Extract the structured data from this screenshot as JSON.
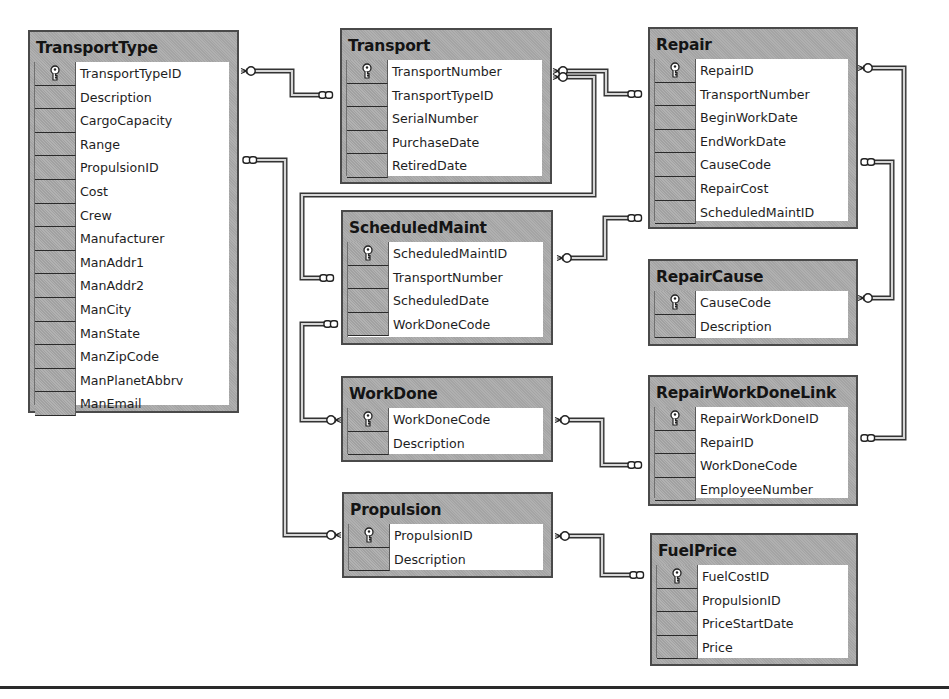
{
  "diagram": {
    "type": "database-schema",
    "tables": [
      {
        "name": "TransportType",
        "columns": [
          "TransportTypeID",
          "Description",
          "CargoCapacity",
          "Range",
          "PropulsionID",
          "Cost",
          "Crew",
          "Manufacturer",
          "ManAddr1",
          "ManAddr2",
          "ManCity",
          "ManState",
          "ManZipCode",
          "ManPlanetAbbrv",
          "ManEmail"
        ],
        "primary_key": "TransportTypeID"
      },
      {
        "name": "Transport",
        "columns": [
          "TransportNumber",
          "TransportTypeID",
          "SerialNumber",
          "PurchaseDate",
          "RetiredDate"
        ],
        "primary_key": "TransportNumber"
      },
      {
        "name": "Repair",
        "columns": [
          "RepairID",
          "TransportNumber",
          "BeginWorkDate",
          "EndWorkDate",
          "CauseCode",
          "RepairCost",
          "ScheduledMaintID"
        ],
        "primary_key": "RepairID"
      },
      {
        "name": "ScheduledMaint",
        "columns": [
          "ScheduledMaintID",
          "TransportNumber",
          "ScheduledDate",
          "WorkDoneCode"
        ],
        "primary_key": "ScheduledMaintID"
      },
      {
        "name": "RepairCause",
        "columns": [
          "CauseCode",
          "Description"
        ],
        "primary_key": "CauseCode"
      },
      {
        "name": "WorkDone",
        "columns": [
          "WorkDoneCode",
          "Description"
        ],
        "primary_key": "WorkDoneCode"
      },
      {
        "name": "RepairWorkDoneLink",
        "columns": [
          "RepairWorkDoneID",
          "RepairID",
          "WorkDoneCode",
          "EmployeeNumber"
        ],
        "primary_key": "RepairWorkDoneID"
      },
      {
        "name": "Propulsion",
        "columns": [
          "PropulsionID",
          "Description"
        ],
        "primary_key": "PropulsionID"
      },
      {
        "name": "FuelPrice",
        "columns": [
          "FuelCostID",
          "PropulsionID",
          "PriceStartDate",
          "Price"
        ],
        "primary_key": "FuelCostID"
      }
    ],
    "relationships": [
      {
        "from": "TransportType.TransportTypeID",
        "to": "Transport.TransportTypeID",
        "type": "one-to-many"
      },
      {
        "from": "Transport.TransportNumber",
        "to": "Repair.TransportNumber",
        "type": "one-to-many"
      },
      {
        "from": "Transport.TransportNumber",
        "to": "ScheduledMaint.TransportNumber",
        "type": "one-to-many"
      },
      {
        "from": "ScheduledMaint.ScheduledMaintID",
        "to": "Repair.ScheduledMaintID",
        "type": "one-to-many"
      },
      {
        "from": "RepairCause.CauseCode",
        "to": "Repair.CauseCode",
        "type": "one-to-many"
      },
      {
        "from": "Repair.RepairID",
        "to": "RepairWorkDoneLink.RepairID",
        "type": "one-to-many"
      },
      {
        "from": "WorkDone.WorkDoneCode",
        "to": "ScheduledMaint.WorkDoneCode",
        "type": "one-to-many"
      },
      {
        "from": "WorkDone.WorkDoneCode",
        "to": "RepairWorkDoneLink.WorkDoneCode",
        "type": "one-to-many"
      },
      {
        "from": "Propulsion.PropulsionID",
        "to": "TransportType.PropulsionID",
        "type": "one-to-many"
      },
      {
        "from": "Propulsion.PropulsionID",
        "to": "FuelPrice.PropulsionID",
        "type": "one-to-many"
      }
    ]
  }
}
